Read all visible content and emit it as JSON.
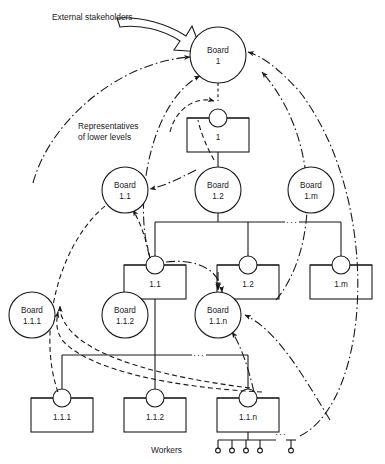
{
  "diagram": {
    "annotations": [
      {
        "id": "external-stakeholders",
        "text": "External stakeholders",
        "x": 52,
        "y": 17
      },
      {
        "id": "representatives",
        "line1": "Representatives",
        "line2": "of lower levels",
        "x": 78,
        "y": 126
      },
      {
        "id": "workers",
        "text": "Workers",
        "x": 182,
        "y": 450
      }
    ],
    "boards": [
      {
        "id": "board-1",
        "line1": "Board",
        "line2": "1",
        "cx": 218,
        "cy": 55,
        "r": 28
      },
      {
        "id": "board-1-1",
        "line1": "Board",
        "line2": "1.1",
        "cx": 125,
        "cy": 190,
        "r": 23
      },
      {
        "id": "board-1-2",
        "line1": "Board",
        "line2": "1.2",
        "cx": 218,
        "cy": 190,
        "r": 23
      },
      {
        "id": "board-1-m",
        "line1": "Board",
        "line2": "1.m",
        "cx": 311,
        "cy": 190,
        "r": 23
      },
      {
        "id": "board-1-1-1",
        "line1": "Board",
        "line2": "1.1.1",
        "cx": 32,
        "cy": 315,
        "r": 23
      },
      {
        "id": "board-1-1-2",
        "line1": "Board",
        "line2": "1.1.2",
        "cx": 125,
        "cy": 315,
        "r": 23
      },
      {
        "id": "board-1-1-n",
        "line1": "Board",
        "line2": "1.1.n",
        "cx": 218,
        "cy": 315,
        "r": 23
      }
    ],
    "units": [
      {
        "id": "unit-1",
        "label": "1",
        "x": 218,
        "y": 118,
        "w": 62,
        "h": 34
      },
      {
        "id": "unit-1-1",
        "label": "1.1",
        "x": 155,
        "y": 265,
        "w": 62,
        "h": 34
      },
      {
        "id": "unit-1-2",
        "label": "1.2",
        "x": 248,
        "y": 265,
        "w": 62,
        "h": 34
      },
      {
        "id": "unit-1-m",
        "label": "1.m",
        "x": 341,
        "y": 265,
        "w": 62,
        "h": 34
      },
      {
        "id": "unit-1-1-1",
        "label": "1.1.1",
        "x": 62,
        "y": 398,
        "w": 62,
        "h": 34
      },
      {
        "id": "unit-1-1-2",
        "label": "1.1.2",
        "x": 155,
        "y": 398,
        "w": 62,
        "h": 34
      },
      {
        "id": "unit-1-1-n",
        "label": "1.1.n",
        "x": 248,
        "y": 398,
        "w": 62,
        "h": 34
      }
    ],
    "ellipses_marks": [
      {
        "id": "ellipsis-row2",
        "text": "···",
        "x": 292,
        "y": 225
      },
      {
        "id": "ellipsis-row3",
        "text": "···",
        "x": 199,
        "y": 358
      },
      {
        "id": "ellipsis-workers",
        "text": "···",
        "x": 265,
        "y": 425
      }
    ],
    "workers": {
      "count_shown": 5,
      "bar_y": 432,
      "stem_xs": [
        218,
        232,
        246,
        260,
        288
      ]
    },
    "colors": {
      "line": "#1a1a1a",
      "text": "#1a1a1a",
      "background": "#ffffff"
    },
    "legend_notes": {
      "solid": "formal hierarchy links",
      "dashed": "representatives of lower levels",
      "dash_dot": "external stakeholder / cross-level links"
    }
  }
}
